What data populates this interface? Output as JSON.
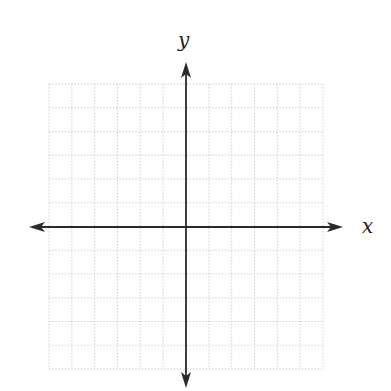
{
  "diagram": {
    "type": "cartesian-coordinate-grid",
    "x_axis_label": "x",
    "y_axis_label": "y",
    "grid": {
      "columns": 12,
      "rows": 12,
      "left": 49,
      "top": 84,
      "right": 323,
      "bottom": 369,
      "line_style": "dotted",
      "color": "#c4c4c4"
    },
    "origin": {
      "x": 186,
      "y": 227
    },
    "axes": {
      "color": "#2a2a2a",
      "x_axis": {
        "from_x": 29,
        "to_x": 343,
        "y": 227
      },
      "y_axis": {
        "x": 186,
        "from_y": 62,
        "to_y": 388
      }
    },
    "labels": {
      "x": {
        "x": 362,
        "y": 233
      },
      "y": {
        "x": 178,
        "y": 47
      }
    }
  }
}
